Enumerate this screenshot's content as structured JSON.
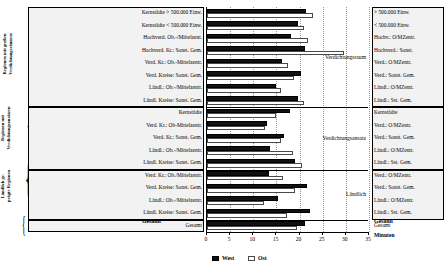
{
  "chart_data": {
    "type": "bar",
    "orientation": "horizontal",
    "title": "",
    "xlabel": "Minuten",
    "ylabel": "",
    "xlim": [
      0,
      35
    ],
    "xticks": [
      0,
      5,
      10,
      15,
      20,
      25,
      30,
      35
    ],
    "grid": true,
    "legend_position": "bottom",
    "series": [
      {
        "name": "West",
        "color": "#111111"
      },
      {
        "name": "Ost",
        "color": "#ffffff"
      }
    ],
    "sections": [
      {
        "title": "Verdichtungsraum",
        "side_caption": "Regionen mit großen Verdichtungsräumen",
        "rows": [
          {
            "left": "Kernstädte > 500.000 Einw.",
            "right": "> 500.000 Einw.",
            "west": 21.4,
            "ost": 23.0
          },
          {
            "left": "Kernstädte < 500.000 Einw.",
            "right": "< 500.000 Einw.",
            "west": 19.7,
            "ost": 20.9
          },
          {
            "left": "Hochverd. Ob.-/Mittelzent.",
            "right": "Hochv.: O/MZentr.",
            "west": 18.2,
            "ost": 21.8
          },
          {
            "left": "Hochverd. Kr.: Sonst. Gem.",
            "right": "Hochverd.: Sonst.",
            "west": 21.2,
            "ost": 29.7
          },
          {
            "left": "Verd. Kr.: Ob.-Mittelzentr.",
            "right": "Verd.: O/MZentr.",
            "west": 16.3,
            "ost": 17.4
          },
          {
            "left": "Verd. Kreise: Sonst. Gem.",
            "right": "Verd.: Sonst. Gem.",
            "west": 20.4,
            "ost": 18.8
          },
          {
            "left": "Ländl.: Ob.-/Mittelzentr.",
            "right": "Ländl.: O/MZentr.",
            "west": 14.9,
            "ost": 16.0
          },
          {
            "left": "Ländl. Kreise: Sonst. Gem.",
            "right": "Ländl.: Sst. Gem.",
            "west": 19.6,
            "ost": 21.0
          }
        ]
      },
      {
        "title": "Verdichtungsansatz",
        "side_caption": "Regionen mit Verdichtungsansätzen",
        "rows": [
          {
            "left": "Kernstädte",
            "right": "Kernstädte",
            "west": 18.0,
            "ost": 15.0
          },
          {
            "left": "Verd. Kr.: Ob-Mittelzentr.",
            "right": "Verd.: O/MZentr.",
            "west": 13.0,
            "ost": 12.5
          },
          {
            "left": "Verd. Kr.: Sonst. Gem.",
            "right": "Verd.: Sonst. Gem.",
            "west": 16.7,
            "ost": 16.0
          },
          {
            "left": "Ländl.: Ob.-/Mittelzentr.",
            "right": "Ländl.: O/MZentr.",
            "west": 13.6,
            "ost": 18.5
          },
          {
            "left": "Ländl. Kreise: Sonst. Gem.",
            "right": "Ländl.: Sst. Gem.",
            "west": 19.0,
            "ost": 20.5
          }
        ]
      },
      {
        "title": "Ländlich",
        "side_caption": "Ländlich ge- prägte Regionen",
        "rows": [
          {
            "left": "Verd. Kr.: Ob./Mittelzentr.",
            "right": "Verd.: O/MZentr.",
            "west": 13.5,
            "ost": 16.4
          },
          {
            "left": "Verd. Kreise: Sonst. Gem.",
            "right": "Verd.: Sonst. Gem.",
            "west": 21.5,
            "ost": 19.0
          },
          {
            "left": "Ländl.: Ob.-/Mittelzentr.",
            "right": "Ländl.: O/MZentr.",
            "west": 15.4,
            "ost": 12.4
          },
          {
            "left": "Ländl. Kreise: Sonst. Gem.",
            "right": "Ländl.: Sst. Gem.",
            "west": 22.3,
            "ost": 17.2
          }
        ]
      },
      {
        "title": "",
        "side_caption": "",
        "rows": [
          {
            "left": "Gesamt",
            "right": "Gesamt",
            "west": 21.2,
            "ost": 19.5
          }
        ]
      }
    ]
  },
  "axis": {
    "unit_label": "Minuten",
    "tick_0": "0",
    "tick_5": "5",
    "tick_10": "10",
    "tick_15": "15",
    "tick_20": "20",
    "tick_25": "25",
    "tick_30": "30",
    "tick_35": "35"
  },
  "legend": {
    "west_label": "West",
    "ost_label": "Ost"
  },
  "totals": {
    "left_label": "Gesamt",
    "right_label": "Gesamt"
  },
  "side_captions": {
    "group1_line1": "Regionen mit großen",
    "group1_line2": "Verdichtungsräumen",
    "group2_line1": "Regionen mit",
    "group2_line2": "Verdichtungsansätzen",
    "group3_line1": "Ländlich ge-",
    "group3_line2": "prägte Regionen"
  },
  "section_titles": {
    "s1": "Verdichtungsraum",
    "s2": "Verdichtungsansatz",
    "s3": "Ländlich"
  }
}
